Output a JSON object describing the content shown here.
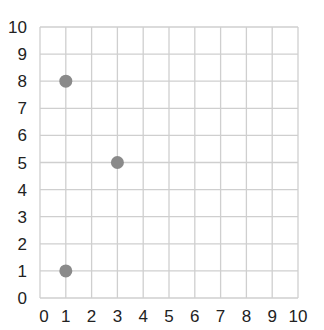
{
  "chart_data": {
    "type": "scatter",
    "title": "",
    "xlabel": "",
    "ylabel": "",
    "xlim": [
      0,
      10
    ],
    "ylim": [
      0,
      10
    ],
    "grid": true,
    "x_ticks": [
      "0",
      "1",
      "2",
      "3",
      "4",
      "5",
      "6",
      "7",
      "8",
      "9",
      "10"
    ],
    "y_ticks": [
      "0",
      "1",
      "2",
      "3",
      "4",
      "5",
      "6",
      "7",
      "8",
      "9",
      "10"
    ],
    "series": [
      {
        "name": "points",
        "points": [
          {
            "x": 1,
            "y": 8
          },
          {
            "x": 3,
            "y": 5
          },
          {
            "x": 1,
            "y": 1
          }
        ]
      }
    ],
    "colors": {
      "point": "#8a8a8a",
      "grid": "#cfcfcf",
      "text": "#222222"
    }
  }
}
